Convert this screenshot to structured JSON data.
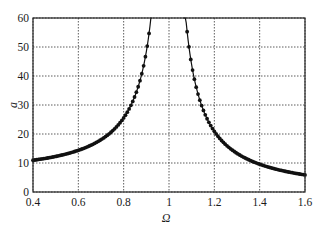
{
  "chart_data": {
    "type": "line",
    "title": "",
    "xlabel": "Ω",
    "ylabel": "a",
    "xlim": [
      0.4,
      1.6
    ],
    "ylim": [
      0,
      60
    ],
    "xticks": [
      "0.4",
      "0.6",
      "0.8",
      "1",
      "1.2",
      "1.4",
      "1.6"
    ],
    "yticks": [
      "0",
      "10",
      "20",
      "30",
      "40",
      "50",
      "60"
    ],
    "grid": true,
    "grid_style": "dotted",
    "legend": null,
    "marker": "dot",
    "series": [
      {
        "name": "a(Ω)",
        "x": [
          0.4,
          0.45,
          0.5,
          0.55,
          0.6,
          0.65,
          0.7,
          0.75,
          0.8,
          0.82,
          0.84,
          0.86,
          0.88,
          0.9,
          0.91,
          0.92,
          1.07,
          1.08,
          1.09,
          1.1,
          1.12,
          1.14,
          1.16,
          1.18,
          1.2,
          1.25,
          1.3,
          1.35,
          1.4,
          1.45,
          1.5,
          1.55,
          1.6
        ],
        "values": [
          11.0,
          11.5,
          12.3,
          13.2,
          14.4,
          15.9,
          18.0,
          21.0,
          25.6,
          28.0,
          31.3,
          35.3,
          40.8,
          48.4,
          53.7,
          60.0,
          59.0,
          54.5,
          48.3,
          43.8,
          37.2,
          31.8,
          27.8,
          24.5,
          20.9,
          16.2,
          13.4,
          11.1,
          9.6,
          8.3,
          7.4,
          6.5,
          5.9
        ]
      }
    ]
  }
}
